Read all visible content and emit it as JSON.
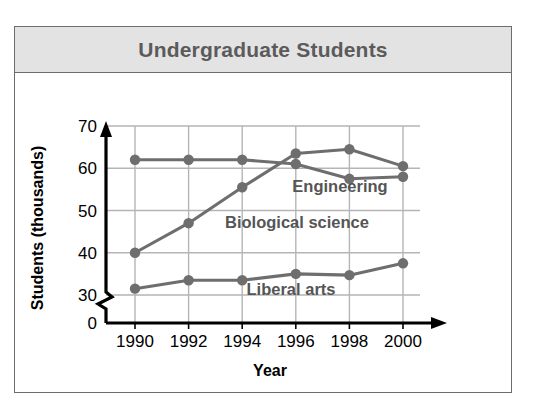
{
  "title": "Undergraduate Students",
  "axes": {
    "ylabel": "Students (thousands)",
    "xlabel": "Year",
    "yticks": [
      "0",
      "30",
      "40",
      "50",
      "60",
      "70"
    ],
    "xticks": [
      "1990",
      "1992",
      "1994",
      "1996",
      "1998",
      "2000"
    ]
  },
  "labels": {
    "engineering": "Engineering",
    "biological": "Biological science",
    "liberal": "Liberal arts"
  },
  "colors": {
    "series": "#6e6e6e",
    "grid": "#b5b5b5",
    "axis": "#000000",
    "title_text": "#5b5b5b",
    "header_bg": "#e3e3e3",
    "frame": "#6d6d6d"
  },
  "chart_data": {
    "type": "line",
    "title": "Undergraduate Students",
    "xlabel": "Year",
    "ylabel": "Students (thousands)",
    "categories": [
      "1990",
      "1992",
      "1994",
      "1996",
      "1998",
      "2000"
    ],
    "x": [
      1990,
      1992,
      1994,
      1996,
      1998,
      2000
    ],
    "ylim": [
      30,
      70
    ],
    "yticks": [
      0,
      30,
      40,
      50,
      60,
      70
    ],
    "y_axis_break": true,
    "grid": true,
    "legend": "inline-labels",
    "series": [
      {
        "name": "Engineering",
        "values": [
          62,
          62,
          62,
          61,
          57.5,
          58
        ]
      },
      {
        "name": "Biological science",
        "values": [
          40,
          47,
          55.5,
          63.5,
          64.5,
          60.5
        ]
      },
      {
        "name": "Liberal arts",
        "values": [
          31.5,
          33.5,
          33.5,
          35,
          34.7,
          37.5
        ]
      }
    ]
  }
}
